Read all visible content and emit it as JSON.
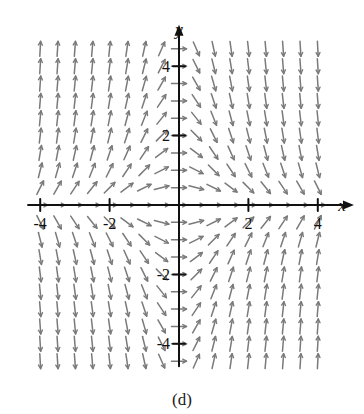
{
  "figure": {
    "caption": "(d)",
    "type": "direction-field"
  },
  "chart_data": {
    "type": "scatter",
    "title": "",
    "subtitle": "",
    "xlabel": "x",
    "ylabel": "y",
    "xlim": [
      -4.35,
      4.35
    ],
    "ylim": [
      -4.65,
      4.65
    ],
    "grid": false,
    "legend": null,
    "x_ticks": [
      -4,
      -2,
      2,
      4
    ],
    "y_ticks": [
      -4,
      -2,
      2,
      4
    ],
    "x_tick_labels": [
      "-4",
      "-2",
      "2",
      "4"
    ],
    "y_tick_labels": [
      "-4",
      "-2",
      "2",
      "4"
    ],
    "field": {
      "description": "slope field dy/dx = -x*y, arrows drawn in +x direction",
      "slope_formula": "-x*y",
      "grid_step": 0.5,
      "x_start": -4.0,
      "x_end": 4.0,
      "y_start": -4.5,
      "y_end": 4.5,
      "segment_length_px": 15,
      "arrow_color": "#7a7a7a",
      "axis_color": "#111111"
    },
    "annotations": [
      {
        "text": "y",
        "x": 0,
        "y": 4.9,
        "italic": true
      },
      {
        "text": "x",
        "x": 4.7,
        "y": 0,
        "italic": true
      }
    ]
  },
  "colors": {
    "background": "#ffffff",
    "axis": "#111111",
    "arrow": "#7a7a7a",
    "text": "#111111"
  }
}
